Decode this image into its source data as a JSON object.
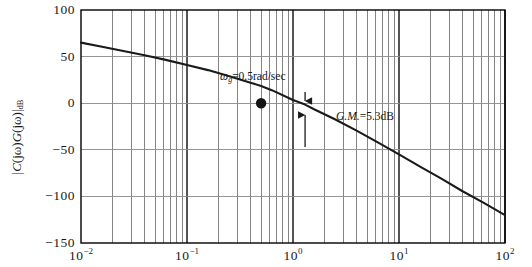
{
  "figure": {
    "type": "bode-magnitude-plot",
    "background_color": "#ffffff",
    "axis_color": "#000000",
    "grid_color": "#808080",
    "curve_color": "#1a1a1a"
  },
  "axes": {
    "ylabel_parts": {
      "bar_open": "|",
      "c": "C",
      "jw1": "(jω)",
      "g": "G",
      "jw2": "(jω)",
      "bar_close": "|",
      "sub": "dB"
    },
    "ylabel_text": "|C(jω)G(jω)|dB",
    "y_ticks": [
      "100",
      "50",
      "0",
      "−50",
      "−100",
      "−150"
    ],
    "y_values": [
      100,
      50,
      0,
      -50,
      -100,
      -150
    ],
    "x_ticks": [
      {
        "mantissa": "10",
        "exponent": "−2"
      },
      {
        "mantissa": "10",
        "exponent": "−1"
      },
      {
        "mantissa": "10",
        "exponent": "0"
      },
      {
        "mantissa": "10",
        "exponent": "1"
      },
      {
        "mantissa": "10",
        "exponent": "2"
      }
    ],
    "x_decades": [
      -2,
      -1,
      0,
      1,
      2
    ],
    "xlim": [
      0.01,
      100
    ],
    "ylim": [
      -150,
      100
    ],
    "grid": "log-minor-vertical-and-major-horizontal"
  },
  "annotations": {
    "gain_crossover": {
      "symbol": "ω",
      "subscript": "g",
      "equals_value": "=0.5rad/sec",
      "full_text": "ωg=0.5rad/sec",
      "freq": 0.5,
      "mag_db": 0
    },
    "gain_margin": {
      "label_italic": "G.M.",
      "label_value": "=5.3dB",
      "full_text": "G.M.=5.3dB",
      "value_db": 5.3,
      "freq": 1.3
    },
    "marker": {
      "name": "gain-crossover-dot",
      "freq": 0.5,
      "mag_db": 0
    },
    "arrows": {
      "down_arrow_name": "gain-margin-down-arrow",
      "up_arrow_name": "gain-margin-up-arrow"
    }
  },
  "chart_data": {
    "type": "line",
    "title": "",
    "xlabel": "",
    "ylabel": "|C(jω)G(jω)|dB",
    "xscale": "log",
    "xlim": [
      0.01,
      100
    ],
    "ylim": [
      -150,
      100
    ],
    "yticks": [
      -150,
      -100,
      -50,
      0,
      50,
      100
    ],
    "xticks": [
      0.01,
      0.1,
      1,
      10,
      100
    ],
    "grid": true,
    "legend": "none",
    "series": [
      {
        "name": "open-loop magnitude",
        "x": [
          0.01,
          0.0158,
          0.0251,
          0.0398,
          0.0631,
          0.1,
          0.158,
          0.251,
          0.398,
          0.5,
          0.631,
          1.0,
          1.3,
          1.58,
          2.51,
          3.98,
          6.31,
          10,
          15.8,
          25.1,
          39.8,
          63.1,
          100
        ],
        "y": [
          65,
          60.5,
          56,
          51.5,
          46.5,
          41,
          35.5,
          29,
          22,
          18.5,
          14,
          3.5,
          -1.5,
          -6.5,
          -17.5,
          -29.5,
          -42,
          -55,
          -68,
          -81,
          -94.5,
          -107,
          -120
        ]
      }
    ],
    "annotations": [
      {
        "text": "ωg=0.5rad/sec",
        "x": 0.5,
        "y": 0
      },
      {
        "text": "G.M.=5.3dB",
        "x": 1.3,
        "y": -5
      }
    ],
    "markers": [
      {
        "x": 0.5,
        "y": 0,
        "style": "filled-circle"
      }
    ]
  }
}
